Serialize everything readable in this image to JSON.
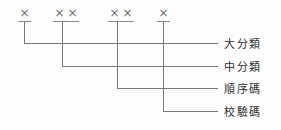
{
  "diagram": {
    "type": "code-structure-breakdown",
    "code_groups": [
      {
        "id": "group-1",
        "chars": "X",
        "char_count": 1,
        "left": 18,
        "width": 13
      },
      {
        "id": "group-2",
        "chars": "XX",
        "char_count": 2,
        "left": 53,
        "width": 26
      },
      {
        "id": "group-3",
        "chars": "XX",
        "char_count": 2,
        "left": 108,
        "width": 26
      },
      {
        "id": "group-4",
        "chars": "X",
        "char_count": 1,
        "left": 157,
        "width": 13
      }
    ],
    "glyph": "×",
    "leaders": [
      {
        "id": "leader-1",
        "x": 24,
        "y": 43,
        "label": "大分類"
      },
      {
        "id": "leader-2",
        "x": 62,
        "y": 66,
        "label": "中分類"
      },
      {
        "id": "leader-3",
        "x": 117,
        "y": 88,
        "label": "順序碼"
      },
      {
        "id": "leader-4",
        "x": 163,
        "y": 111,
        "label": "校驗碼"
      }
    ],
    "labels": {
      "major_category": "大分類",
      "middle_category": "中分類",
      "sequence_code": "順序碼",
      "check_code": "校驗碼"
    },
    "line_end_x": 218,
    "line_start_y": 21,
    "colors": {
      "line": "#7a7a7a",
      "glyph": "#6b6b6b",
      "text": "#2e2e2e",
      "background": "#fdfdfd"
    }
  }
}
